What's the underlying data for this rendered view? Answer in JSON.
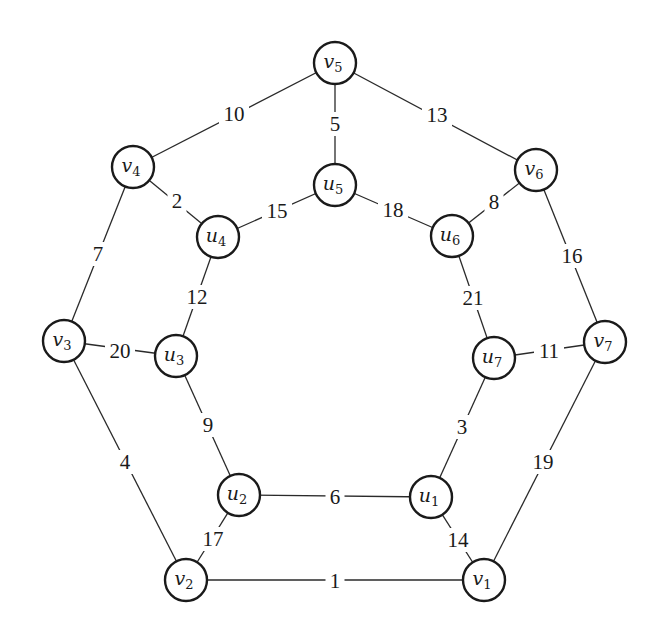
{
  "graph": {
    "node_radius": 21,
    "nodes": [
      {
        "id": "v1",
        "letter": "v",
        "sub": "1",
        "x": 484,
        "y": 580
      },
      {
        "id": "v2",
        "letter": "v",
        "sub": "2",
        "x": 186,
        "y": 580
      },
      {
        "id": "v3",
        "letter": "v",
        "sub": "3",
        "x": 64,
        "y": 341
      },
      {
        "id": "v4",
        "letter": "v",
        "sub": "4",
        "x": 133,
        "y": 167
      },
      {
        "id": "v5",
        "letter": "v",
        "sub": "5",
        "x": 335,
        "y": 63
      },
      {
        "id": "v6",
        "letter": "v",
        "sub": "6",
        "x": 536,
        "y": 170
      },
      {
        "id": "v7",
        "letter": "v",
        "sub": "7",
        "x": 605,
        "y": 342
      },
      {
        "id": "u1",
        "letter": "u",
        "sub": "1",
        "x": 431,
        "y": 497
      },
      {
        "id": "u2",
        "letter": "u",
        "sub": "2",
        "x": 239,
        "y": 495
      },
      {
        "id": "u3",
        "letter": "u",
        "sub": "3",
        "x": 176,
        "y": 356
      },
      {
        "id": "u4",
        "letter": "u",
        "sub": "4",
        "x": 218,
        "y": 237
      },
      {
        "id": "u5",
        "letter": "u",
        "sub": "5",
        "x": 335,
        "y": 185
      },
      {
        "id": "u6",
        "letter": "u",
        "sub": "6",
        "x": 452,
        "y": 236
      },
      {
        "id": "u7",
        "letter": "u",
        "sub": "7",
        "x": 494,
        "y": 358
      }
    ],
    "edges": [
      {
        "from": "v1",
        "to": "v2",
        "weight": "1",
        "lx": 335,
        "ly": 581
      },
      {
        "from": "v4",
        "to": "u4",
        "weight": "2",
        "lx": 177,
        "ly": 201
      },
      {
        "from": "u7",
        "to": "u1",
        "weight": "3",
        "lx": 462,
        "ly": 427
      },
      {
        "from": "v3",
        "to": "v2",
        "weight": "4",
        "lx": 125,
        "ly": 462
      },
      {
        "from": "v5",
        "to": "u5",
        "weight": "5",
        "lx": 335,
        "ly": 124
      },
      {
        "from": "u2",
        "to": "u1",
        "weight": "6",
        "lx": 335,
        "ly": 497
      },
      {
        "from": "v4",
        "to": "v3",
        "weight": "7",
        "lx": 98,
        "ly": 254
      },
      {
        "from": "u6",
        "to": "v6",
        "weight": "8",
        "lx": 494,
        "ly": 202
      },
      {
        "from": "u3",
        "to": "u2",
        "weight": "9",
        "lx": 208,
        "ly": 425
      },
      {
        "from": "v4",
        "to": "v5",
        "weight": "10",
        "lx": 234,
        "ly": 114
      },
      {
        "from": "u7",
        "to": "v7",
        "weight": "11",
        "lx": 549,
        "ly": 351
      },
      {
        "from": "u4",
        "to": "u3",
        "weight": "12",
        "lx": 197,
        "ly": 297
      },
      {
        "from": "v5",
        "to": "v6",
        "weight": "13",
        "lx": 437,
        "ly": 115
      },
      {
        "from": "u1",
        "to": "v1",
        "weight": "14",
        "lx": 458,
        "ly": 540
      },
      {
        "from": "u4",
        "to": "u5",
        "weight": "15",
        "lx": 277,
        "ly": 211
      },
      {
        "from": "v6",
        "to": "v7",
        "weight": "16",
        "lx": 572,
        "ly": 256
      },
      {
        "from": "u2",
        "to": "v2",
        "weight": "17",
        "lx": 213,
        "ly": 539
      },
      {
        "from": "u5",
        "to": "u6",
        "weight": "18",
        "lx": 393,
        "ly": 210
      },
      {
        "from": "v7",
        "to": "v1",
        "weight": "19",
        "lx": 543,
        "ly": 462
      },
      {
        "from": "v3",
        "to": "u3",
        "weight": "20",
        "lx": 120,
        "ly": 351
      },
      {
        "from": "u6",
        "to": "u7",
        "weight": "21",
        "lx": 473,
        "ly": 298
      }
    ]
  }
}
